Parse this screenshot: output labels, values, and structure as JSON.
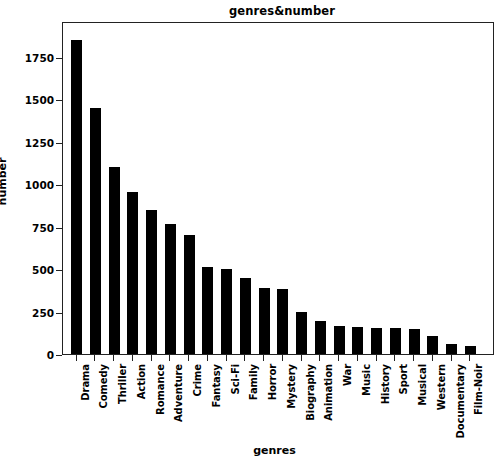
{
  "chart_data": {
    "type": "bar",
    "title": "genres&number",
    "xlabel": "genres",
    "ylabel": "number",
    "categories": [
      "Drama",
      "Comedy",
      "Thriller",
      "Action",
      "Romance",
      "Adventure",
      "Crime",
      "Fantasy",
      "Sci-Fi",
      "Family",
      "Horror",
      "Mystery",
      "Biography",
      "Animation",
      "War",
      "Music",
      "History",
      "Sport",
      "Musical",
      "Western",
      "Documentary",
      "Film-Noir"
    ],
    "values": [
      1850,
      1450,
      1100,
      955,
      850,
      765,
      700,
      510,
      500,
      445,
      390,
      385,
      250,
      195,
      165,
      160,
      155,
      155,
      150,
      105,
      60,
      50
    ],
    "ylim": [
      0,
      1960
    ],
    "yticks": [
      0,
      250,
      500,
      750,
      1000,
      1250,
      1500,
      1750
    ],
    "ytick_labels": [
      "0",
      "250",
      "500",
      "750",
      "1000",
      "1250",
      "1500",
      "1750"
    ],
    "grid": false,
    "legend": null,
    "bar_color": "#000000",
    "background_color": "#ffffff",
    "axis_color": "#222222"
  }
}
